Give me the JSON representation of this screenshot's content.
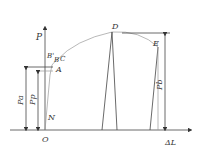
{
  "diagram": {
    "type": "load-elongation curve",
    "axes": {
      "y_label": "P",
      "x_label": "ΔL",
      "origin": "O"
    },
    "points": {
      "N": "N",
      "A": "A",
      "B_prime": "B'",
      "B": "B",
      "C": "C",
      "D": "D",
      "E": "E"
    },
    "dimensions": {
      "pa": "Pa",
      "pp": "Pp",
      "pb": "Pb"
    }
  }
}
